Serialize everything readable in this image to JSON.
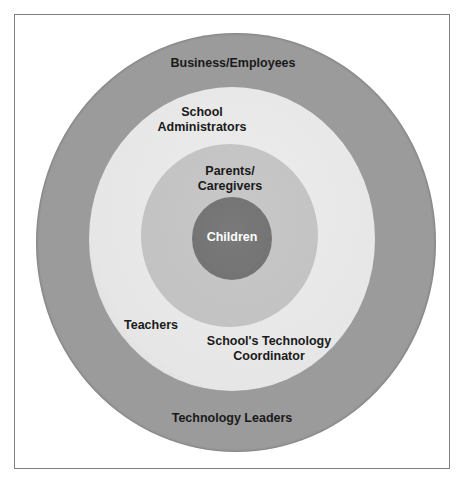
{
  "diagram": {
    "type": "concentric-circles",
    "colors": {
      "outer_ring": "#9b9b9b",
      "light_ring": "#e6e6e6",
      "parents_ring": "#c2c2c2",
      "children_core": "#777777",
      "frame": "#7f7f7f",
      "text": "#1a1a1a",
      "core_text": "#ffffff"
    },
    "outer_ring": {
      "top_label": "Business/Employees",
      "bottom_label": "Technology Leaders"
    },
    "light_ring": {
      "top_label_lines": [
        "School",
        "Administrators"
      ],
      "left_label": "Teachers",
      "bottom_label_lines": [
        "School's Technology",
        "Coordinator"
      ]
    },
    "parents_ring": {
      "label_lines": [
        "Parents/",
        "Caregivers"
      ]
    },
    "core": {
      "label": "Children"
    }
  }
}
